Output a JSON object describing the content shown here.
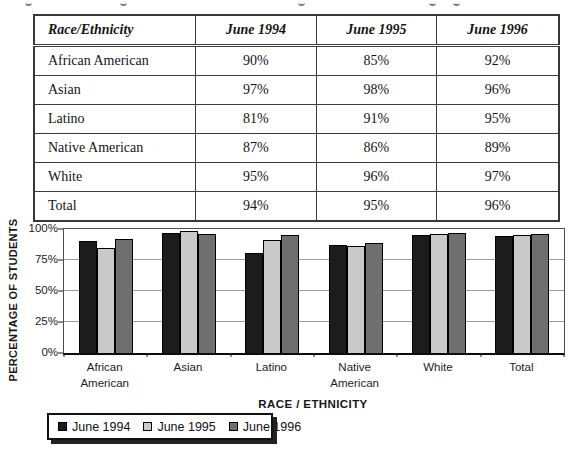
{
  "page": {
    "background": "#ffffff"
  },
  "table": {
    "columns": [
      "Race/Ethnicity",
      "June 1994",
      "June 1995",
      "June 1996"
    ],
    "rows": [
      {
        "label": "African American",
        "values": [
          "90%",
          "85%",
          "92%"
        ]
      },
      {
        "label": "Asian",
        "values": [
          "97%",
          "98%",
          "96%"
        ]
      },
      {
        "label": "Latino",
        "values": [
          "81%",
          "91%",
          "95%"
        ]
      },
      {
        "label": "Native American",
        "values": [
          "87%",
          "86%",
          "89%"
        ]
      },
      {
        "label": "White",
        "values": [
          "95%",
          "96%",
          "97%"
        ]
      },
      {
        "label": "Total",
        "values": [
          "94%",
          "95%",
          "96%"
        ]
      }
    ]
  },
  "chart_data": {
    "type": "bar",
    "title": "",
    "categories": [
      "African\nAmerican",
      "Asian",
      "Latino",
      "Native\nAmerican",
      "White",
      "Total"
    ],
    "series": [
      {
        "name": "June 1994",
        "color": "#1c1c1c",
        "values": [
          90,
          97,
          81,
          87,
          95,
          94
        ]
      },
      {
        "name": "June 1995",
        "color": "#c9c9c9",
        "values": [
          85,
          98,
          91,
          86,
          96,
          95
        ]
      },
      {
        "name": "June 1996",
        "color": "#6f6f6f",
        "values": [
          92,
          96,
          95,
          89,
          97,
          96
        ]
      }
    ],
    "xlabel": "RACE / ETHNICITY",
    "ylabel": "PERCENTAGE OF STUDENTS",
    "ylim": [
      0,
      100
    ],
    "y_ticks": [
      "100%",
      "75%",
      "50%",
      "25%",
      "0%"
    ],
    "grid": true,
    "legend_position": "bottom-left",
    "bar_outline_color": "#000000"
  }
}
